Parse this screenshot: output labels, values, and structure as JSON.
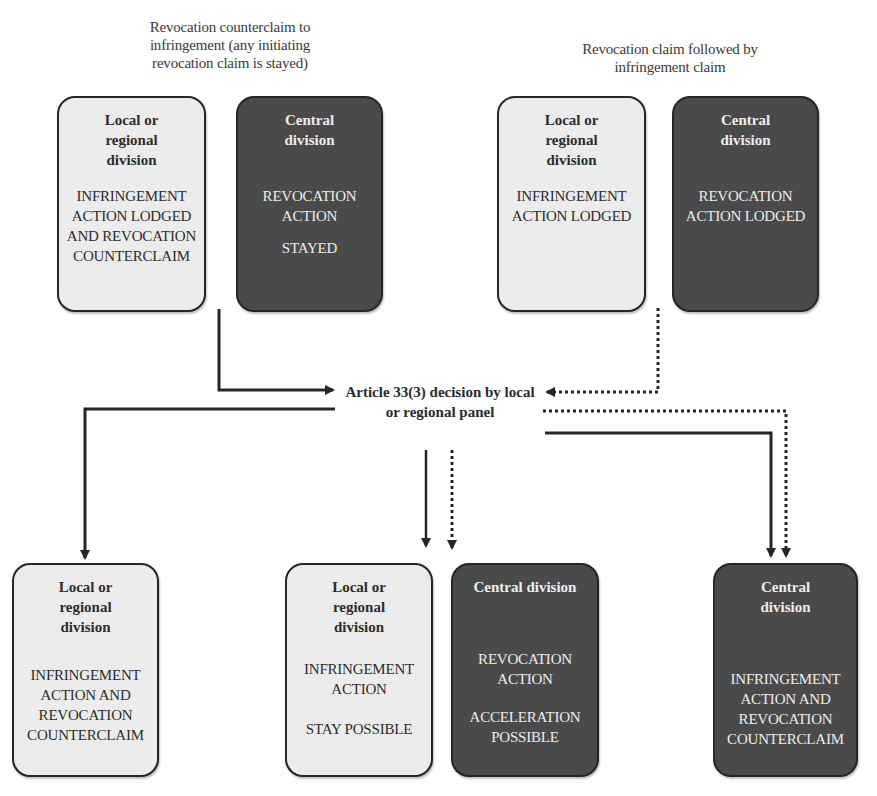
{
  "captions": {
    "left": "Revocation counterclaim to infringement (any initiating revocation claim is stayed)",
    "right": "Revocation claim followed by infringement claim"
  },
  "top_left": {
    "local": {
      "title": "Local or regional division",
      "body": "INFRINGEMENT ACTION LODGED AND REVOCATION COUNTERCLAIM"
    },
    "central": {
      "title": "Central division",
      "body": "REVOCATION ACTION",
      "body2": "STAYED"
    }
  },
  "top_right": {
    "local": {
      "title": "Local or regional division",
      "body": "INFRINGEMENT ACTION LODGED"
    },
    "central": {
      "title": "Central division",
      "body": "REVOCATION ACTION LODGED"
    }
  },
  "decision": {
    "label": "Article 33(3) decision by local or regional panel"
  },
  "bottom_left": {
    "local": {
      "title": "Local or regional division",
      "body": "INFRINGEMENT ACTION AND REVOCATION COUNTERCLAIM"
    }
  },
  "bottom_middle": {
    "local": {
      "title": "Local or regional division",
      "body": "INFRINGEMENT ACTION",
      "body2": "STAY POSSIBLE"
    },
    "central": {
      "title": "Central division",
      "body": "REVOCATION ACTION",
      "body2": "ACCELERATION POSSIBLE"
    }
  },
  "bottom_right": {
    "central": {
      "title": "Central division",
      "body": "INFRINGEMENT ACTION AND REVOCATION COUNTERCLAIM"
    }
  },
  "legend": {
    "solid_path": "Revocation counterclaim to infringement",
    "dotted_path": "Revocation claim followed by infringement claim"
  },
  "colors": {
    "local_box": "#ececec",
    "central_box": "#4a4a4a",
    "line": "#262626"
  }
}
